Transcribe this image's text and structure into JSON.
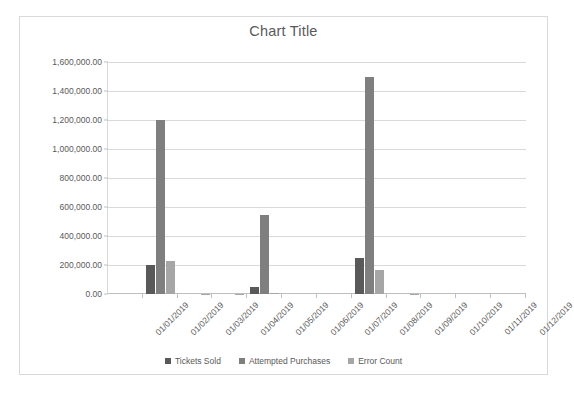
{
  "chart_data": {
    "type": "bar",
    "title": "Chart Title",
    "xlabel": "",
    "ylabel": "",
    "ylim": [
      0,
      1600000
    ],
    "ytick_step": 200000,
    "ytick_labels": [
      "0.00",
      "200,000.00",
      "400,000.00",
      "600,000.00",
      "800,000.00",
      "1,000,000.00",
      "1,200,000.00",
      "1,400,000.00",
      "1,600,000.00"
    ],
    "ytick_values": [
      0,
      200000,
      400000,
      600000,
      800000,
      1000000,
      1200000,
      1400000,
      1600000
    ],
    "grid": true,
    "legend_position": "bottom",
    "categories": [
      "01/01/2019",
      "01/02/2019",
      "01/03/2019",
      "01/04/2019",
      "01/05/2019",
      "01/06/2019",
      "01/07/2019",
      "01/08/2019",
      "01/09/2019",
      "01/10/2019",
      "01/11/2019",
      "01/12/2019"
    ],
    "series": [
      {
        "name": "Tickets Sold",
        "color": "#595959",
        "values": [
          0,
          200000,
          0,
          0,
          50000,
          0,
          0,
          250000,
          0,
          0,
          0,
          0
        ]
      },
      {
        "name": "Attempted Purchases",
        "color": "#7f7f7f",
        "values": [
          0,
          1200000,
          0,
          0,
          545000,
          0,
          0,
          1500000,
          0,
          0,
          0,
          0
        ]
      },
      {
        "name": "Error Count",
        "color": "#a6a6a6",
        "values": [
          0,
          225000,
          3000,
          3000,
          5000,
          0,
          0,
          165000,
          3000,
          0,
          0,
          0
        ]
      }
    ]
  },
  "colors": {
    "series_1": "#595959",
    "series_2": "#7f7f7f",
    "series_3": "#a6a6a6",
    "gridline": "#d9d9d9",
    "text": "#595959",
    "frame_border": "#d9d9d9",
    "background": "#ffffff"
  }
}
